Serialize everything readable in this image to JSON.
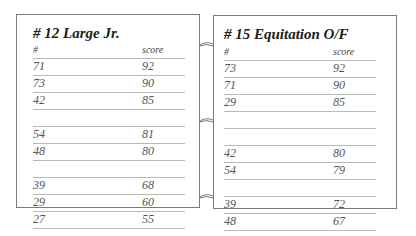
{
  "panels": [
    {
      "title": "# 12 Large Jr.",
      "columns": [
        "#",
        "score"
      ],
      "rows": [
        {
          "num": "71",
          "score": "92"
        },
        {
          "num": "73",
          "score": "90"
        },
        {
          "num": "42",
          "score": "85"
        },
        {
          "num": "",
          "score": ""
        },
        {
          "num": "54",
          "score": "81"
        },
        {
          "num": "48",
          "score": "80"
        },
        {
          "num": "",
          "score": ""
        },
        {
          "num": "39",
          "score": "68"
        },
        {
          "num": "29",
          "score": "60"
        },
        {
          "num": "27",
          "score": "55"
        }
      ]
    },
    {
      "title": "# 15 Equitation O/F",
      "columns": [
        "#",
        "score"
      ],
      "rows": [
        {
          "num": "73",
          "score": "92"
        },
        {
          "num": "71",
          "score": "90"
        },
        {
          "num": "29",
          "score": "85"
        },
        {
          "num": "",
          "score": ""
        },
        {
          "num": "",
          "score": ""
        },
        {
          "num": "42",
          "score": "80"
        },
        {
          "num": "54",
          "score": "79"
        },
        {
          "num": "",
          "score": ""
        },
        {
          "num": "39",
          "score": "72"
        },
        {
          "num": "48",
          "score": "67"
        }
      ]
    }
  ]
}
